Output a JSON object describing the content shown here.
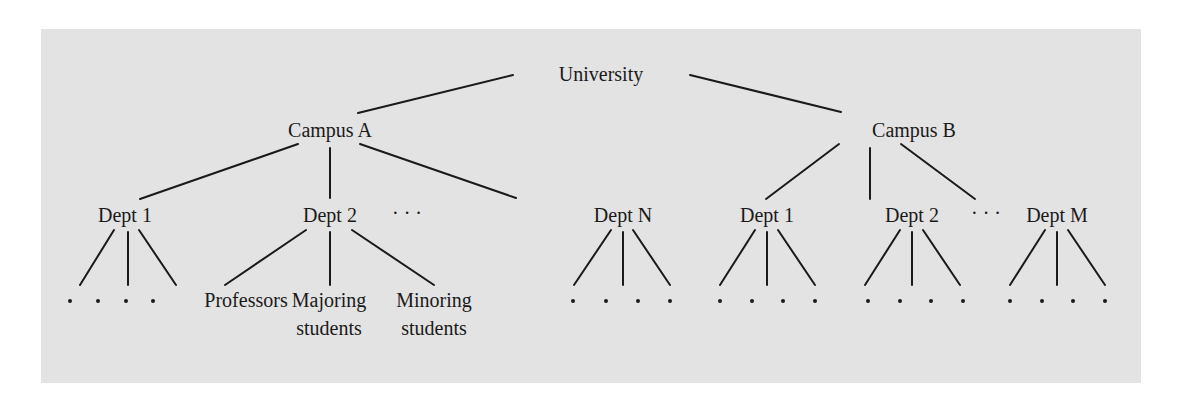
{
  "colors": {
    "panel": "#e3e3e3",
    "ink": "#1a1a1a",
    "background": "#ffffff"
  },
  "diagram": {
    "type": "hierarchy-tree",
    "root": {
      "label": "University",
      "x": 579,
      "y": 81
    },
    "campuses": [
      {
        "id": "campus-a",
        "label": "Campus A",
        "x": 330,
        "y": 137
      },
      {
        "id": "campus-b",
        "label": "Campus B",
        "x": 870,
        "y": 137
      }
    ],
    "departments": [
      {
        "id": "a-dept-1",
        "campus": "campus-a",
        "label": "Dept 1",
        "x": 125,
        "y": 222
      },
      {
        "id": "a-dept-2",
        "campus": "campus-a",
        "label": "Dept 2",
        "x": 330,
        "y": 222
      },
      {
        "id": "a-ellipsis",
        "campus": "campus-a",
        "label": "· · ·",
        "x": 414,
        "y": 220
      },
      {
        "id": "a-dept-n",
        "campus": "campus-a",
        "label": "Dept N",
        "x": 537,
        "y": 222
      },
      {
        "id": "b-dept-1",
        "campus": "campus-b",
        "label": "Dept 1",
        "x": 767,
        "y": 222
      },
      {
        "id": "b-dept-2",
        "campus": "campus-b",
        "label": "Dept 2",
        "x": 920,
        "y": 222
      },
      {
        "id": "b-ellipsis",
        "campus": "campus-b",
        "label": "· · ·",
        "x": 986,
        "y": 220
      },
      {
        "id": "b-dept-m",
        "campus": "campus-b",
        "label": "Dept M",
        "x": 1057,
        "y": 222
      }
    ],
    "dept2_children": [
      {
        "label_line1": "Professors",
        "label_line2": "",
        "x": 246,
        "y": 307
      },
      {
        "label_line1": "Majoring",
        "label_line2": "students",
        "x": 330,
        "y": 307
      },
      {
        "label_line1": "Minoring",
        "label_line2": "students",
        "x": 434,
        "y": 307
      }
    ],
    "leaf_placeholder": "·"
  }
}
